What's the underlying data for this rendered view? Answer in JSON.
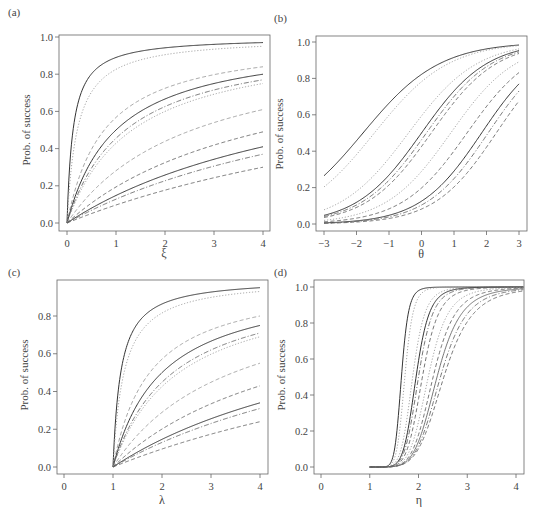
{
  "chart_data": [
    {
      "panel": "(a)",
      "type": "line",
      "title": "",
      "xlabel": "ξ",
      "ylabel": "Prob. of success",
      "xlim": [
        0,
        4
      ],
      "ylim": [
        0,
        1
      ],
      "xticks": [
        0,
        1,
        2,
        3,
        4
      ],
      "yticks": [
        "0.0",
        "0.2",
        "0.4",
        "0.6",
        "0.8",
        "1.0"
      ],
      "grid": false,
      "legend": null,
      "model": "hyperbolic",
      "x_start": 0,
      "series": [
        {
          "name": "curve-1",
          "style": "solid",
          "shade": "dark",
          "end_value": 0.97
        },
        {
          "name": "curve-2",
          "style": "dotted",
          "shade": "light",
          "end_value": 0.95
        },
        {
          "name": "curve-3",
          "style": "dashed",
          "shade": "light",
          "end_value": 0.84
        },
        {
          "name": "curve-4",
          "style": "solid",
          "shade": "dark",
          "end_value": 0.8
        },
        {
          "name": "curve-5",
          "style": "dashdot",
          "shade": "mid",
          "end_value": 0.77
        },
        {
          "name": "curve-6",
          "style": "dotted",
          "shade": "light",
          "end_value": 0.75
        },
        {
          "name": "curve-7",
          "style": "dashed",
          "shade": "light",
          "end_value": 0.61
        },
        {
          "name": "curve-8",
          "style": "dashed",
          "shade": "mid",
          "end_value": 0.49
        },
        {
          "name": "curve-9",
          "style": "solid",
          "shade": "dark",
          "end_value": 0.41
        },
        {
          "name": "curve-10",
          "style": "dashdot",
          "shade": "mid",
          "end_value": 0.37
        },
        {
          "name": "curve-11",
          "style": "dashed",
          "shade": "mid",
          "end_value": 0.3
        }
      ]
    },
    {
      "panel": "(b)",
      "type": "line",
      "title": "",
      "xlabel": "θ",
      "ylabel": "Prob. of success",
      "xlim": [
        -3,
        3
      ],
      "ylim": [
        0,
        1
      ],
      "xticks": [
        -3,
        -2,
        -1,
        0,
        1,
        2,
        3
      ],
      "yticks": [
        "0.0",
        "0.2",
        "0.4",
        "0.6",
        "0.8",
        "1.0"
      ],
      "grid": false,
      "legend": null,
      "model": "logistic",
      "series": [
        {
          "name": "curve-1",
          "style": "solid",
          "shade": "dark",
          "slope": 0.85,
          "midpoint": -1.8
        },
        {
          "name": "curve-2",
          "style": "dotted",
          "shade": "light",
          "slope": 0.88,
          "midpoint": -1.45
        },
        {
          "name": "curve-3",
          "style": "dotted",
          "shade": "light",
          "slope": 0.95,
          "midpoint": -0.4
        },
        {
          "name": "curve-4",
          "style": "solid",
          "shade": "dark",
          "slope": 1.0,
          "midpoint": 0.0
        },
        {
          "name": "curve-5",
          "style": "dashdot",
          "shade": "mid",
          "slope": 1.0,
          "midpoint": 0.15
        },
        {
          "name": "curve-6",
          "style": "dashed",
          "shade": "mid",
          "slope": 1.0,
          "midpoint": 0.3
        },
        {
          "name": "curve-7",
          "style": "dotted",
          "shade": "light",
          "slope": 1.0,
          "midpoint": 0.9
        },
        {
          "name": "curve-8",
          "style": "dashed",
          "shade": "mid",
          "slope": 1.0,
          "midpoint": 1.4
        },
        {
          "name": "curve-9",
          "style": "solid",
          "shade": "dark",
          "slope": 1.05,
          "midpoint": 1.85
        },
        {
          "name": "curve-10",
          "style": "dashdot",
          "shade": "mid",
          "slope": 1.05,
          "midpoint": 2.05
        },
        {
          "name": "curve-11",
          "style": "dashed",
          "shade": "mid",
          "slope": 1.05,
          "midpoint": 2.3
        }
      ]
    },
    {
      "panel": "(c)",
      "type": "line",
      "title": "",
      "xlabel": "λ",
      "ylabel": "Prob. of success",
      "xlim": [
        0,
        4
      ],
      "ylim": [
        0,
        0.95
      ],
      "xticks": [
        0,
        1,
        2,
        3,
        4
      ],
      "yticks": [
        "0.0",
        "0.2",
        "0.4",
        "0.6",
        "0.8"
      ],
      "grid": false,
      "legend": null,
      "model": "hyperbolic",
      "x_start": 1,
      "series": [
        {
          "name": "curve-1",
          "style": "solid",
          "shade": "dark",
          "end_value": 0.95
        },
        {
          "name": "curve-2",
          "style": "dotted",
          "shade": "light",
          "end_value": 0.93
        },
        {
          "name": "curve-3",
          "style": "dashed",
          "shade": "light",
          "end_value": 0.8
        },
        {
          "name": "curve-4",
          "style": "solid",
          "shade": "dark",
          "end_value": 0.75
        },
        {
          "name": "curve-5",
          "style": "dashdot",
          "shade": "mid",
          "end_value": 0.71
        },
        {
          "name": "curve-6",
          "style": "dotted",
          "shade": "light",
          "end_value": 0.69
        },
        {
          "name": "curve-7",
          "style": "dashed",
          "shade": "light",
          "end_value": 0.55
        },
        {
          "name": "curve-8",
          "style": "dashed",
          "shade": "mid",
          "end_value": 0.43
        },
        {
          "name": "curve-9",
          "style": "solid",
          "shade": "dark",
          "end_value": 0.34
        },
        {
          "name": "curve-10",
          "style": "dashdot",
          "shade": "mid",
          "end_value": 0.31
        },
        {
          "name": "curve-11",
          "style": "dashed",
          "shade": "mid",
          "end_value": 0.24
        }
      ]
    },
    {
      "panel": "(d)",
      "type": "line",
      "title": "",
      "xlabel": "η",
      "ylabel": "Prob. of success",
      "xlim": [
        0,
        4.15
      ],
      "ylim": [
        0,
        1
      ],
      "xticks": [
        0,
        1,
        2,
        3,
        4
      ],
      "yticks": [
        "0.0",
        "0.2",
        "0.4",
        "0.6",
        "0.8",
        "1.0"
      ],
      "grid": false,
      "legend": null,
      "model": "shifted-sigmoid",
      "x_start": 1,
      "series": [
        {
          "name": "curve-1",
          "style": "solid",
          "shade": "dark",
          "midpoint": 1.65,
          "slope": 9.0
        },
        {
          "name": "curve-2",
          "style": "dotted",
          "shade": "light",
          "midpoint": 1.72,
          "slope": 8.5
        },
        {
          "name": "curve-3",
          "style": "dotted",
          "shade": "light",
          "midpoint": 1.88,
          "slope": 7.0
        },
        {
          "name": "curve-4",
          "style": "solid",
          "shade": "dark",
          "midpoint": 1.95,
          "slope": 7.0
        },
        {
          "name": "curve-5",
          "style": "dashdot",
          "shade": "mid",
          "midpoint": 2.0,
          "slope": 6.8
        },
        {
          "name": "curve-6",
          "style": "dashed",
          "shade": "mid",
          "midpoint": 2.08,
          "slope": 6.5
        },
        {
          "name": "curve-7",
          "style": "dotted",
          "shade": "light",
          "midpoint": 2.2,
          "slope": 6.0
        },
        {
          "name": "curve-8",
          "style": "dashed",
          "shade": "mid",
          "midpoint": 2.3,
          "slope": 5.8
        },
        {
          "name": "curve-9",
          "style": "solid",
          "shade": "mid",
          "midpoint": 2.38,
          "slope": 5.6
        },
        {
          "name": "curve-10",
          "style": "dashdot",
          "shade": "mid",
          "midpoint": 2.45,
          "slope": 5.4
        },
        {
          "name": "curve-11",
          "style": "dashed",
          "shade": "mid",
          "midpoint": 2.52,
          "slope": 5.2
        }
      ]
    }
  ],
  "panels": [
    {
      "label": "(a)",
      "xlabel": "ξ",
      "ylabel": "Prob. of success"
    },
    {
      "label": "(b)",
      "xlabel": "θ",
      "ylabel": "Prob. of success"
    },
    {
      "label": "(c)",
      "xlabel": "λ",
      "ylabel": "Prob. of success"
    },
    {
      "label": "(d)",
      "xlabel": "η",
      "ylabel": "Prob. of success"
    }
  ],
  "colors": {
    "axis": "#666666",
    "dark": "#333333",
    "mid": "#666666",
    "light": "#9a9a9a",
    "text": "#444444",
    "background": "#ffffff"
  }
}
